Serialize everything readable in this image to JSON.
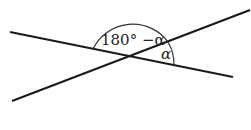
{
  "diagram": {
    "type": "intersecting-lines-angles",
    "labels": {
      "supplementary_angle": "180° −α",
      "angle": "α"
    },
    "colors": {
      "line": "#1a1a1a",
      "arc": "#333333",
      "background": "#ffffff"
    }
  }
}
